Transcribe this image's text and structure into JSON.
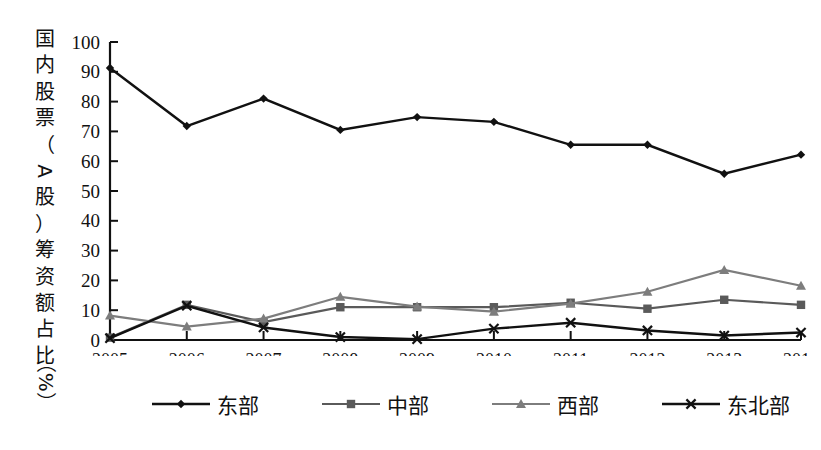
{
  "chart_data": {
    "type": "line",
    "title": "",
    "xlabel": "",
    "ylabel": "国内股票（A股）筹资额占比（%）",
    "categories": [
      "2005",
      "2006",
      "2007",
      "2008",
      "2009",
      "2010",
      "2011",
      "2012",
      "2013",
      "2014"
    ],
    "xlim": [
      2005,
      2014
    ],
    "ylim": [
      0,
      100
    ],
    "yticks": [
      0,
      10,
      20,
      30,
      40,
      50,
      60,
      70,
      80,
      90,
      100
    ],
    "grid": false,
    "legend_position": "bottom",
    "series": [
      {
        "name": "东部",
        "marker": "diamond",
        "color": "#111111",
        "values": [
          91.3,
          71.8,
          81.0,
          70.5,
          74.8,
          73.2,
          65.5,
          65.5,
          55.8,
          62.2
        ]
      },
      {
        "name": "中部",
        "marker": "square",
        "color": "#5a5a5a",
        "values": [
          0.8,
          11.8,
          6.0,
          11.0,
          11.0,
          11.0,
          12.5,
          10.5,
          13.5,
          11.8
        ]
      },
      {
        "name": "西部",
        "marker": "triangle",
        "color": "#7d7d7d",
        "values": [
          8.2,
          4.5,
          7.2,
          14.5,
          11.2,
          9.5,
          12.2,
          16.2,
          23.5,
          18.2
        ]
      },
      {
        "name": "东北部",
        "marker": "cross",
        "color": "#111111",
        "values": [
          0.6,
          11.5,
          4.2,
          1.0,
          0.3,
          3.8,
          5.8,
          3.2,
          1.5,
          2.5
        ]
      }
    ]
  },
  "ylabel_chars": [
    "国",
    "内",
    "股",
    "票",
    "（",
    "A",
    "股",
    "）",
    "筹",
    "资",
    "额",
    "占",
    "比",
    "（%）"
  ],
  "legend": {
    "items": [
      {
        "label": "东部",
        "marker": "diamond",
        "color": "#111111"
      },
      {
        "label": "中部",
        "marker": "square",
        "color": "#5a5a5a"
      },
      {
        "label": "西部",
        "marker": "triangle",
        "color": "#7d7d7d"
      },
      {
        "label": "东北部",
        "marker": "cross",
        "color": "#111111"
      }
    ]
  }
}
